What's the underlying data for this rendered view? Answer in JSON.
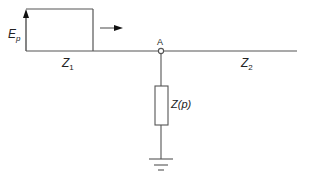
{
  "diagram": {
    "type": "circuit",
    "source": {
      "label": "E",
      "subscript": "p"
    },
    "line_left": {
      "label": "Z",
      "subscript": "1"
    },
    "line_right": {
      "label": "Z",
      "subscript": "2"
    },
    "node": {
      "label": "A"
    },
    "shunt": {
      "label": "Z(p)"
    },
    "colors": {
      "stroke": "#444444",
      "text": "#222222"
    }
  }
}
